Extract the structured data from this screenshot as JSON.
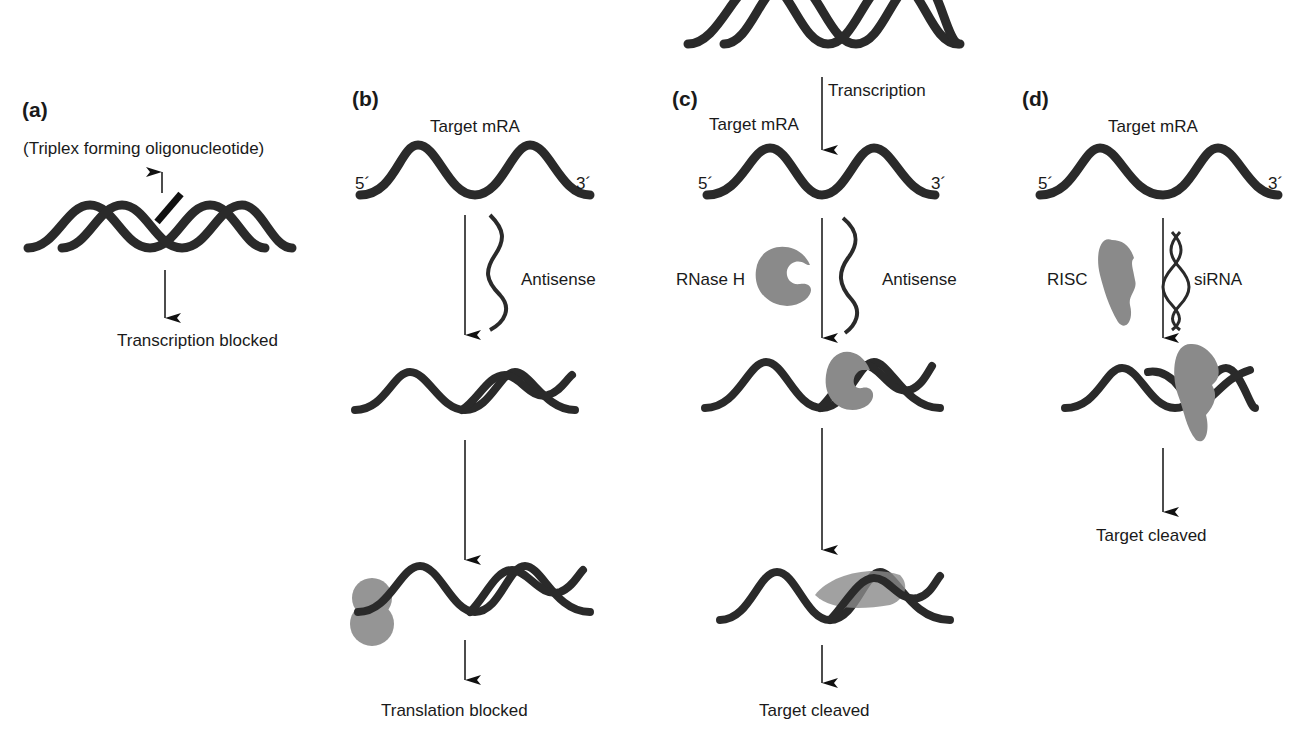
{
  "diagram": {
    "type": "mechanism-of-gene-silencing",
    "panels": [
      {
        "id": "a",
        "label": "(a)",
        "agent": "(Triplex forming oligonucleotide)",
        "target": "DNA double helix",
        "outcome": "Transcription blocked"
      },
      {
        "id": "b",
        "label": "(b)",
        "target_label": "Target mRA",
        "five_prime": "5´",
        "three_prime": "3´",
        "agent": "Antisense",
        "outcome": "Translation blocked"
      },
      {
        "id": "c",
        "label": "(c)",
        "step_label": "Transcription",
        "target_label": "Target mRA",
        "five_prime": "5´",
        "three_prime": "3´",
        "enzyme": "RNase H",
        "agent": "Antisense",
        "outcome": "Target cleaved"
      },
      {
        "id": "d",
        "label": "(d)",
        "target_label": "Target mRA",
        "five_prime": "5´",
        "three_prime": "3´",
        "enzyme": "RISC",
        "agent": "siRNA",
        "outcome": "Target cleaved"
      }
    ],
    "colors": {
      "strand": "#2a2a2a",
      "protein": "#8a8a8a",
      "text": "#1a1a1a"
    }
  }
}
